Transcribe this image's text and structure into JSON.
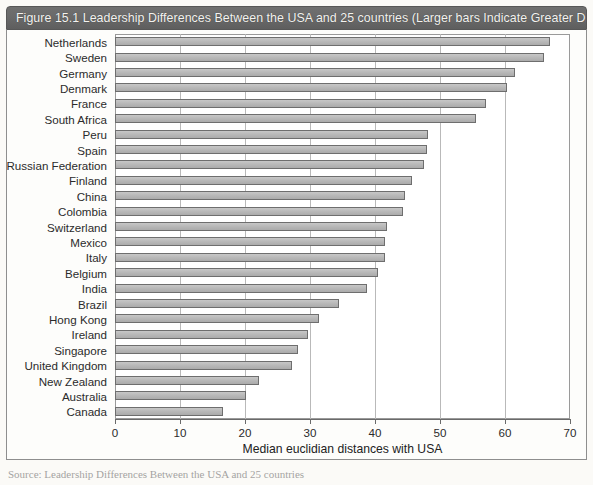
{
  "figure": {
    "title": "Figure 15.1  Leadership Differences Between the USA and 25 countries (Larger bars Indicate Greater Differences)",
    "title_bar_color": "#666666",
    "bar_fill_color": "#bababa",
    "bar_border_color": "#6e6e6e",
    "source_note": "Source: Leadership Differences Between the USA and 25 countries"
  },
  "chart_data": {
    "type": "bar",
    "orientation": "horizontal",
    "title": "Leadership Differences Between the USA and 25 countries (Larger bars Indicate Greater Differences)",
    "xlabel": "Median euclidian distances with USA",
    "ylabel": "",
    "xlim": [
      0,
      70
    ],
    "xticks": [
      0,
      10,
      20,
      30,
      40,
      50,
      60,
      70
    ],
    "grid": true,
    "grid_axis": "x",
    "legend": false,
    "categories": [
      "Netherlands",
      "Sweden",
      "Germany",
      "Denmark",
      "France",
      "South Africa",
      "Peru",
      "Spain",
      "Russian Federation",
      "Finland",
      "China",
      "Colombia",
      "Switzerland",
      "Mexico",
      "Italy",
      "Belgium",
      "India",
      "Brazil",
      "Hong Kong",
      "Ireland",
      "Singapore",
      "United Kingdom",
      "New Zealand",
      "Australia",
      "Canada"
    ],
    "values": [
      66.9,
      66.0,
      61.5,
      60.3,
      57.1,
      55.5,
      48.2,
      48.0,
      47.6,
      45.7,
      44.6,
      44.3,
      41.8,
      41.5,
      41.6,
      40.4,
      38.7,
      34.4,
      31.4,
      29.7,
      28.2,
      27.3,
      22.1,
      20.1,
      16.6
    ]
  },
  "bleed_text": "the changes in cultural values and attitudes that will enable the leadership transformation to take place. The leadership culture of organizations may be slightly or even fundamentally different depending on the national culture in which they operate. The Netherlands will have a very different cultural background to Brazil, for example, and leaders in these countries will need to understand the implications of these differences on both their own behaviour and that of their teams. Global leaders therefore need to be culturally agile and able to adapt their leadership style."
}
